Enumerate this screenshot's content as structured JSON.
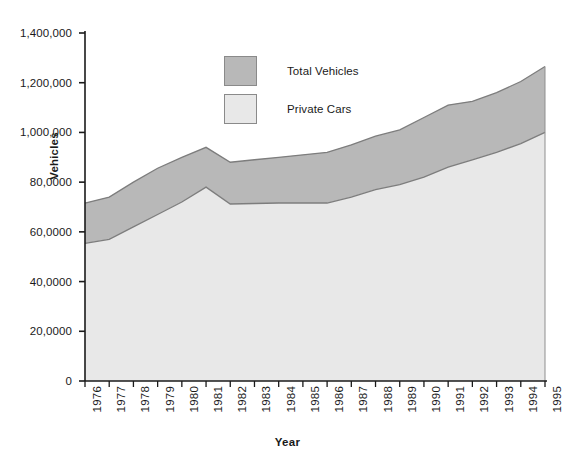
{
  "chart_data": {
    "type": "area",
    "title": "",
    "xlabel": "Year",
    "ylabel": "Vehicles",
    "grid": false,
    "legend_position": "top-center",
    "stacked": false,
    "xlim": [
      1976,
      1995
    ],
    "ylim": [
      0,
      1400000
    ],
    "ytick_values": [
      0,
      200000,
      400000,
      600000,
      800000,
      1000000,
      1200000,
      1400000
    ],
    "ytick_labels": [
      "0",
      "20,0000",
      "40,0000",
      "60,0000",
      "80,0000",
      "1,000,000",
      "1,200,000",
      "1,400,000"
    ],
    "categories": [
      1976,
      1977,
      1978,
      1979,
      1980,
      1981,
      1982,
      1983,
      1984,
      1985,
      1986,
      1987,
      1988,
      1989,
      1990,
      1991,
      1992,
      1993,
      1994,
      1995
    ],
    "xtick_labels": [
      "1976",
      "1977",
      "1978",
      "1979",
      "1980",
      "1981",
      "1982",
      "1983",
      "1984",
      "1985",
      "1986",
      "1987",
      "1988",
      "1989",
      "1990",
      "1991",
      "1992",
      "1993",
      "1994",
      "1995"
    ],
    "series": [
      {
        "name": "Total Vehicles",
        "color": "#b8b8b8",
        "values": [
          716000,
          740000,
          800000,
          856000,
          900000,
          940000,
          880000,
          890000,
          900000,
          910000,
          920000,
          950000,
          985000,
          1010000,
          1060000,
          1110000,
          1125000,
          1160000,
          1205000,
          1265000
        ]
      },
      {
        "name": "Private Cars",
        "color": "#e8e8e8",
        "values": [
          554000,
          570000,
          620000,
          670000,
          720000,
          780000,
          712000,
          714000,
          716000,
          716000,
          716000,
          740000,
          770000,
          790000,
          820000,
          860000,
          890000,
          920000,
          955000,
          1000000
        ]
      }
    ]
  },
  "legend": {
    "items": [
      {
        "label": "Total Vehicles",
        "color": "#b8b8b8"
      },
      {
        "label": "Private Cars",
        "color": "#e8e8e8"
      }
    ]
  },
  "axes": {
    "y_title": "Vehicles",
    "x_title": "Year"
  }
}
